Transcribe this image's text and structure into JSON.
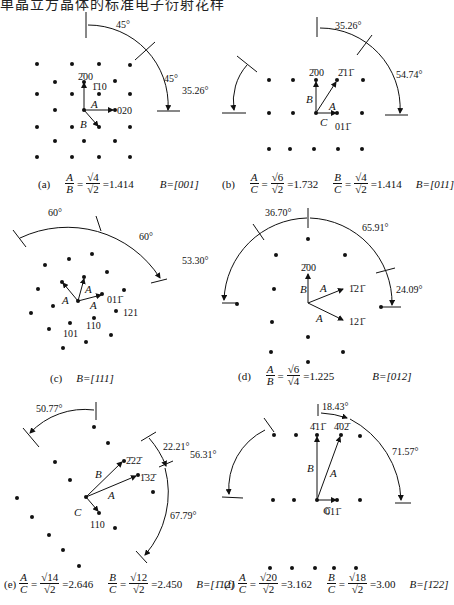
{
  "header": {
    "text": "单晶立方晶体的标准电子衍射花样"
  },
  "panels": [
    {
      "id": "a",
      "label": "(a)",
      "ratios": [
        {
          "lhs_num": "A",
          "lhs_den": "B",
          "rhs_num": "√4",
          "rhs_den": "√2",
          "value": "=1.414"
        }
      ],
      "zone_axis": "B=[001]",
      "spot_labels": [
        "2̄00",
        "1̄10",
        "020"
      ],
      "vectors": [
        "A",
        "B"
      ],
      "angles": [
        "45°",
        "45°"
      ]
    },
    {
      "id": "b",
      "label": "(b)",
      "ratios": [
        {
          "lhs_num": "A",
          "lhs_den": "C",
          "rhs_num": "√6",
          "rhs_den": "√2",
          "value": "=1.732"
        },
        {
          "lhs_num": "B",
          "lhs_den": "C",
          "rhs_num": "√4",
          "rhs_den": "√2",
          "value": "=1.414"
        }
      ],
      "zone_axis": "B=[011]",
      "spot_labels": [
        "2̄00",
        "2̄11̄",
        "011̄"
      ],
      "vectors": [
        "A",
        "B",
        "C"
      ],
      "angles": [
        "35.26°",
        "35.26°",
        "54.74°"
      ]
    },
    {
      "id": "c",
      "label": "(c)",
      "ratios": [],
      "zone_axis": "B=[111]",
      "spot_labels": [
        "011̄",
        "121",
        "110",
        "101"
      ],
      "vectors": [
        "A",
        "A",
        "A"
      ],
      "angles": [
        "60°",
        "60°"
      ]
    },
    {
      "id": "d",
      "label": "(d)",
      "ratios": [
        {
          "lhs_num": "A",
          "lhs_den": "B",
          "rhs_num": "√6",
          "rhs_den": "√4",
          "value": "=1.225"
        }
      ],
      "zone_axis": "B=[012]",
      "spot_labels": [
        "2̄00",
        "1̄21̄",
        "121̄"
      ],
      "vectors": [
        "A",
        "A",
        "B"
      ],
      "angles": [
        "36.70°",
        "65.91°",
        "53.30°",
        "24.09°"
      ]
    },
    {
      "id": "e",
      "label": "(e)",
      "ratios": [
        {
          "lhs_num": "A",
          "lhs_den": "C",
          "rhs_num": "√14",
          "rhs_den": "√2",
          "value": "=2.646"
        },
        {
          "lhs_num": "B",
          "lhs_den": "C",
          "rhs_num": "√12",
          "rhs_den": "√2",
          "value": "=2.450"
        }
      ],
      "zone_axis": "B=[1̄12]",
      "spot_labels": [
        "2̄22̄",
        "1̄32̄",
        "110"
      ],
      "vectors": [
        "A",
        "B",
        "C"
      ],
      "angles": [
        "50.77°",
        "22.21°",
        "67.79°"
      ]
    },
    {
      "id": "f",
      "label": "(f)",
      "ratios": [
        {
          "lhs_num": "A",
          "lhs_den": "C",
          "rhs_num": "√20",
          "rhs_den": "√2",
          "value": "=3.162"
        },
        {
          "lhs_num": "B",
          "lhs_den": "C",
          "rhs_num": "√18",
          "rhs_den": "√2",
          "value": "=3.00"
        }
      ],
      "zone_axis": "B=[1̄22]",
      "spot_labels": [
        "4̄11̄",
        "4̄02̄",
        "011̄"
      ],
      "vectors": [
        "A",
        "B",
        "C"
      ],
      "angles": [
        "18.43°",
        "56.31°",
        "71.57°"
      ]
    }
  ]
}
